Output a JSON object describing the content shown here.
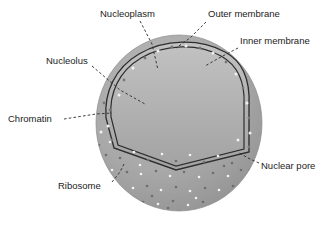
{
  "figure": {
    "type": "biological-diagram",
    "background_color": "#ffffff"
  },
  "colors": {
    "cytoplasm_surface": "#a8a8a8",
    "cytoplasm_shadow": "#9a9a9a",
    "nucleoplasm": "#e2e2dd",
    "nucleoplasm_shaded": "#cfcfca",
    "nucleolus": "#c3c3be",
    "chromatin": "#8e8e8e",
    "membrane_line": "#2e2e2e",
    "membrane_fill": "#b5b5b5",
    "ribosome_light": "#f4f4f0",
    "ribosome_dark": "#6e6e6e",
    "pore_light": "#f2f2ee",
    "pore_dark": "#787878",
    "label_text": "#1b1b1b",
    "leader_line": "#2a2a2a"
  },
  "labels": [
    {
      "id": "nucleoplasm",
      "text": "Nucleoplasm",
      "x": 100,
      "y": 14,
      "anchor": "start"
    },
    {
      "id": "outer_membrane",
      "text": "Outer membrane",
      "x": 208,
      "y": 14,
      "anchor": "start"
    },
    {
      "id": "inner_membrane",
      "text": "Inner membrane",
      "x": 240,
      "y": 41,
      "anchor": "start"
    },
    {
      "id": "nucleolus",
      "text": "Nucleolus",
      "x": 46,
      "y": 61,
      "anchor": "start"
    },
    {
      "id": "chromatin",
      "text": "Chromatin",
      "x": 8,
      "y": 119,
      "anchor": "start"
    },
    {
      "id": "nuclear_pore",
      "text": "Nuclear pore",
      "x": 261,
      "y": 166,
      "anchor": "start"
    },
    {
      "id": "ribosome",
      "text": "Ribosome",
      "x": 58,
      "y": 186,
      "anchor": "start"
    }
  ],
  "leaders": [
    {
      "id": "leader-nucleoplasm",
      "points": "140,21 152,44 158,70"
    },
    {
      "id": "leader-outer-membrane",
      "points": "206,22 190,38 176,48"
    },
    {
      "id": "leader-inner-membrane",
      "points": "238,48 219,58 205,66"
    },
    {
      "id": "leader-nucleolus",
      "points": "92,66 120,90 145,104"
    },
    {
      "id": "leader-chromatin",
      "points": "64,119 96,114 112,113"
    },
    {
      "id": "leader-nuclear-pore",
      "points": "259,163 248,158 238,152"
    },
    {
      "id": "leader-ribosome",
      "points": "112,182 120,172 124,164"
    }
  ],
  "structures": {
    "sphere": {
      "cx": 179,
      "cy": 123,
      "rx": 83,
      "ry": 88
    },
    "nucleolus": {
      "cx": 148,
      "cy": 110,
      "r": 22
    },
    "membrane_note": "double dark line forming the nuclear envelope rim of the cut-away"
  },
  "ribosome_dots": {
    "count_light": 26,
    "count_dark": 40,
    "diameter_px": 2.4,
    "region": "lower cytoplasm surface of the sphere"
  },
  "nuclear_pores": {
    "count": 22,
    "description": "light and dark dots arranged along the cut rim of the nuclear envelope"
  }
}
